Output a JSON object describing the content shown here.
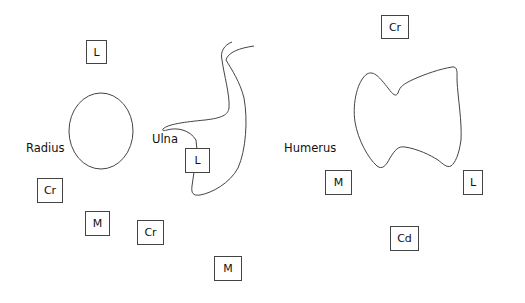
{
  "diagram": {
    "bones": {
      "radius": {
        "label": "Radius"
      },
      "ulna": {
        "label": "Ulna"
      },
      "humerus": {
        "label": "Humerus"
      }
    },
    "direction_boxes": [
      {
        "id": "radius-lateral",
        "label": "L"
      },
      {
        "id": "ulna-lateral",
        "label": "L"
      },
      {
        "id": "radius-cranial",
        "label": "Cr"
      },
      {
        "id": "radius-medial",
        "label": "M"
      },
      {
        "id": "ulna-cranial",
        "label": "Cr"
      },
      {
        "id": "ulna-medial",
        "label": "M"
      },
      {
        "id": "humerus-cranial",
        "label": "Cr"
      },
      {
        "id": "humerus-medial",
        "label": "M"
      },
      {
        "id": "humerus-lateral",
        "label": "L"
      },
      {
        "id": "humerus-caudal",
        "label": "Cd"
      }
    ]
  }
}
